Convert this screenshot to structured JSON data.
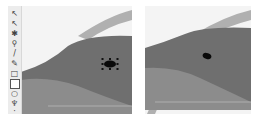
{
  "toolbar": {
    "tools": [
      {
        "name": "selection-tool",
        "glyph": "↖"
      },
      {
        "name": "direct-selection-tool",
        "glyph": "↖"
      },
      {
        "name": "magic-wand-tool",
        "glyph": "✱"
      },
      {
        "name": "zoom-tool",
        "glyph": "⚲"
      },
      {
        "name": "pen-tool",
        "glyph": "/"
      },
      {
        "name": "pencil-tool",
        "glyph": "✎"
      },
      {
        "name": "rectangle-tool",
        "glyph": "□"
      },
      {
        "name": "ellipse-tool",
        "glyph": "▣",
        "active": true
      },
      {
        "name": "polygon-tool",
        "glyph": "○"
      },
      {
        "name": "eyedropper-tool",
        "glyph": "♆"
      },
      {
        "name": "more-tools",
        "glyph": "·"
      }
    ]
  },
  "artwork": {
    "subject": "dolphin",
    "colors": {
      "background": "#f4f4f4",
      "body_dark": "#6f6f6f",
      "body_light": "#8c8c8c",
      "stripe": "#a9a9a9",
      "eye": "#0a0a0a",
      "handle": "#111111"
    }
  },
  "panels": {
    "left": {
      "state": "eye ellipse selected"
    },
    "right": {
      "state": "eye ellipse deselected"
    }
  }
}
